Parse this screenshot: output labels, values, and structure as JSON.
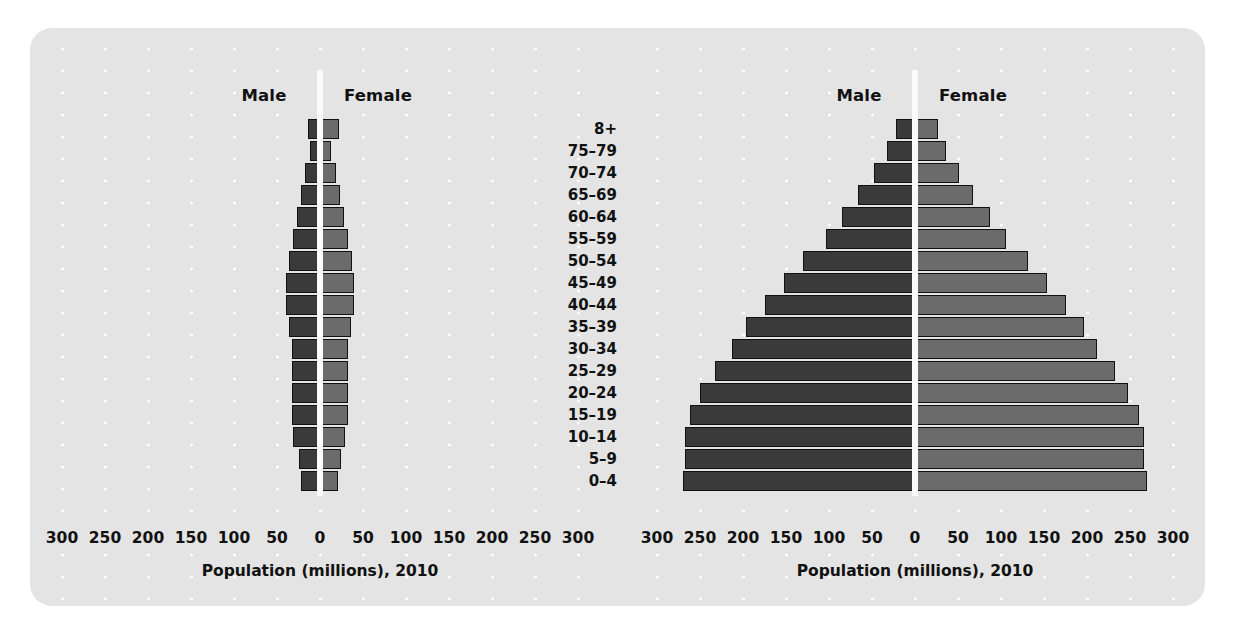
{
  "figure": {
    "background_color": "#e4e4e4",
    "page_color": "#ffffff",
    "male_color": "#3a3a3a",
    "female_color": "#6b6b6b",
    "axis_color": "#fbfbfb"
  },
  "age_groups": [
    "8+",
    "75–79",
    "70–74",
    "65–69",
    "60–64",
    "55–59",
    "50–54",
    "45–49",
    "40–44",
    "35–39",
    "30–34",
    "25–29",
    "20–24",
    "15–19",
    "10–14",
    "5–9",
    "0–4"
  ],
  "shared": {
    "male_label": "Male",
    "female_label": "Female",
    "x_axis_label": "Population (millions), 2010",
    "tick_labels": [
      "300",
      "250",
      "200",
      "150",
      "100",
      "50",
      "0",
      "50",
      "100",
      "150",
      "200",
      "250",
      "300"
    ],
    "tick_values": [
      -300,
      -250,
      -200,
      -150,
      -100,
      -50,
      0,
      50,
      100,
      150,
      200,
      250,
      300
    ]
  },
  "chart_data": [
    {
      "type": "bar",
      "id": "left-pyramid",
      "title": "",
      "subtype": "population-pyramid",
      "orientation": "horizontal-diverging",
      "xlabel": "Population (millions), 2010",
      "ylabel": "",
      "xlim": [
        -300,
        300
      ],
      "grid": false,
      "legend": [
        "Male",
        "Female"
      ],
      "legend_position": "top",
      "categories": [
        "8+",
        "75–79",
        "70–74",
        "65–69",
        "60–64",
        "55–59",
        "50–54",
        "45–49",
        "40–44",
        "35–39",
        "30–34",
        "25–29",
        "20–24",
        "15–19",
        "10–14",
        "5–9",
        "0–4"
      ],
      "series": [
        {
          "name": "Male",
          "values": [
            14,
            12,
            18,
            22,
            27,
            31,
            36,
            40,
            40,
            36,
            33,
            33,
            33,
            33,
            31,
            25,
            22
          ]
        },
        {
          "name": "Female",
          "values": [
            22,
            13,
            19,
            23,
            28,
            32,
            37,
            40,
            40,
            36,
            33,
            33,
            33,
            32,
            29,
            24,
            21
          ]
        }
      ]
    },
    {
      "type": "bar",
      "id": "right-pyramid",
      "title": "",
      "subtype": "population-pyramid",
      "orientation": "horizontal-diverging",
      "xlabel": "Population (millions), 2010",
      "ylabel": "",
      "xlim": [
        -300,
        300
      ],
      "grid": false,
      "legend": [
        "Male",
        "Female"
      ],
      "legend_position": "top",
      "categories": [
        "8+",
        "75–79",
        "70–74",
        "65–69",
        "60–64",
        "55–59",
        "50–54",
        "45–49",
        "40–44",
        "35–39",
        "30–34",
        "25–29",
        "20–24",
        "15–19",
        "10–14",
        "5–9",
        "0–4"
      ],
      "series": [
        {
          "name": "Male",
          "values": [
            22,
            32,
            48,
            66,
            85,
            104,
            130,
            152,
            175,
            196,
            213,
            233,
            250,
            262,
            268,
            268,
            270
          ]
        },
        {
          "name": "Female",
          "values": [
            27,
            36,
            51,
            68,
            87,
            106,
            131,
            153,
            176,
            196,
            212,
            232,
            248,
            260,
            266,
            266,
            270
          ]
        }
      ]
    }
  ],
  "left_chart": {
    "male_label": "Male",
    "female_label": "Female",
    "x_axis_label": "Population (millions), 2010"
  },
  "right_chart": {
    "male_label": "Male",
    "female_label": "Female",
    "x_axis_label": "Population (millions), 2010"
  }
}
